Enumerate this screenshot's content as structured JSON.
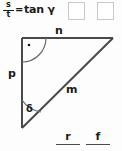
{
  "equation": {
    "fraction_numerator": "s",
    "fraction_denominator": "t",
    "equals": "=",
    "right_side": "tan γ"
  },
  "answer_boxes": [
    {
      "name": "answer-box-1",
      "value": ""
    },
    {
      "name": "answer-box-2",
      "value": ""
    }
  ],
  "figure": {
    "type": "right-triangle",
    "labels": {
      "top_side": "n",
      "left_side": "p",
      "hypotenuse": "m",
      "angle_bottom": "δ",
      "right_angle_marker": "·"
    },
    "stroke_color": "#4a4a4a",
    "vertices": {
      "top_left": [
        22,
        14
      ],
      "top_right": [
        113,
        14
      ],
      "bottom_left": [
        22,
        104
      ]
    }
  },
  "bottom_fractions": [
    {
      "name": "fraction-r",
      "numerator": "r",
      "denominator": ""
    },
    {
      "name": "fraction-f",
      "numerator": "f",
      "denominator": ""
    }
  ],
  "colors": {
    "background": "#fdfdfd",
    "ink": "#1a1a1a",
    "line": "#4a4a4a",
    "box_border": "#c9c9c9"
  }
}
